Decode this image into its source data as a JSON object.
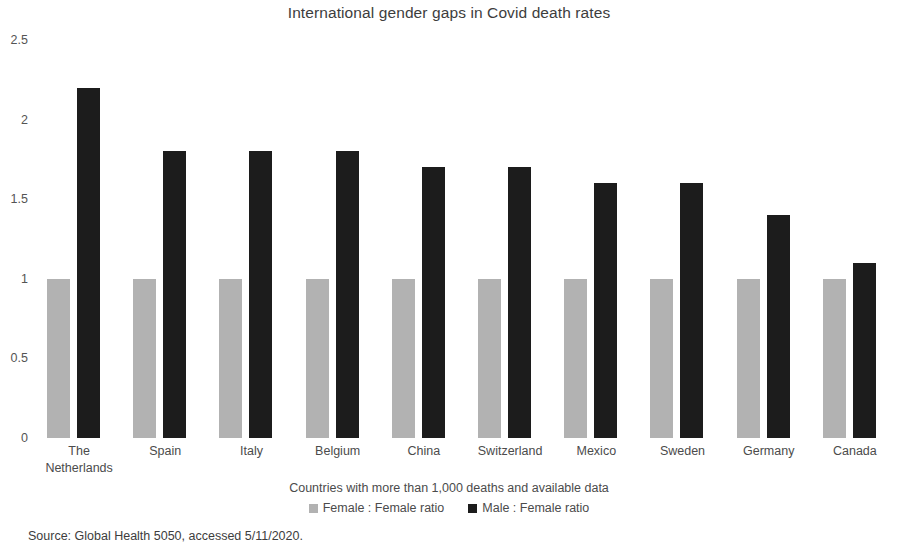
{
  "chart_data": {
    "type": "bar",
    "title": "International gender gaps in Covid death rates",
    "xlabel": "Countries with more than 1,000 deaths and available data",
    "ylabel": "",
    "ylim": [
      0,
      2.5
    ],
    "yticks": [
      "0",
      "0.5",
      "1",
      "1.5",
      "2",
      "2.5"
    ],
    "ytick_values": [
      0,
      0.5,
      1,
      1.5,
      2,
      2.5
    ],
    "grid": false,
    "legend_position": "bottom",
    "categories": [
      "The Netherlands",
      "Spain",
      "Italy",
      "Belgium",
      "China",
      "Switzerland",
      "Mexico",
      "Sweden",
      "Germany",
      "Canada"
    ],
    "category_lines": [
      [
        "The",
        "Netherlands"
      ],
      [
        "Spain"
      ],
      [
        "Italy"
      ],
      [
        "Belgium"
      ],
      [
        "China"
      ],
      [
        "Switzerland"
      ],
      [
        "Mexico"
      ],
      [
        "Sweden"
      ],
      [
        "Germany"
      ],
      [
        "Canada"
      ]
    ],
    "series": [
      {
        "name": "Female : Female ratio",
        "color": "#b2b2b2",
        "values": [
          1,
          1,
          1,
          1,
          1,
          1,
          1,
          1,
          1,
          1
        ]
      },
      {
        "name": "Male : Female ratio",
        "color": "#1c1c1c",
        "values": [
          2.2,
          1.8,
          1.8,
          1.8,
          1.7,
          1.7,
          1.6,
          1.6,
          1.4,
          1.1
        ]
      }
    ]
  },
  "source_note": "Source: Global Health 5050, accessed 5/11/2020."
}
